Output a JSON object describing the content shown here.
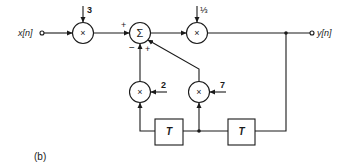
{
  "diagram": {
    "caption": "(b)",
    "input": {
      "label": "x[n]"
    },
    "output": {
      "label": "y[n]"
    },
    "blocks": {
      "mult_input": {
        "symbol": "×",
        "gain": "3"
      },
      "summer": {
        "symbol": "Σ",
        "sign_input": "+",
        "sign_left_feedback": "−",
        "sign_right_feedback": "+"
      },
      "mult_output": {
        "symbol": "×",
        "gain": "⅓"
      },
      "mult_fb1": {
        "symbol": "×",
        "gain": "2"
      },
      "mult_fb2": {
        "symbol": "×",
        "gain": "7"
      },
      "delay1": {
        "label": "T"
      },
      "delay2": {
        "label": "T"
      }
    },
    "colors": {
      "line": "#1a1a1a",
      "background": "#ffffff"
    }
  }
}
